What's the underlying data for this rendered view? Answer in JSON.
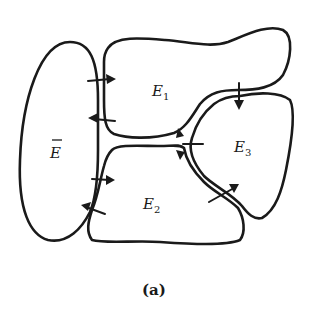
{
  "figure": {
    "caption": "(a)",
    "regions": [
      {
        "id": "E_bar",
        "label": "E",
        "overline": true,
        "subscript": ""
      },
      {
        "id": "E1",
        "label": "E",
        "subscript": "1"
      },
      {
        "id": "E2",
        "label": "E",
        "subscript": "2"
      },
      {
        "id": "E3",
        "label": "E",
        "subscript": "3"
      }
    ],
    "flows": [
      {
        "from": "E_bar",
        "to": "E1",
        "direction": "right"
      },
      {
        "from": "E1",
        "to": "E_bar",
        "direction": "left"
      },
      {
        "from": "E_bar",
        "to": "E2",
        "direction": "right"
      },
      {
        "from": "E2",
        "to": "E_bar",
        "direction": "left"
      },
      {
        "from": "E1",
        "to": "E3",
        "direction": "down"
      },
      {
        "from": "E2",
        "to": "E3",
        "direction": "up-right"
      },
      {
        "from": "E2",
        "to": "E1",
        "direction": "up"
      },
      {
        "from": "E1",
        "to": "E2",
        "direction": "down"
      }
    ],
    "colors": {
      "ink": "#1a1a1a",
      "background": "#ffffff"
    }
  }
}
